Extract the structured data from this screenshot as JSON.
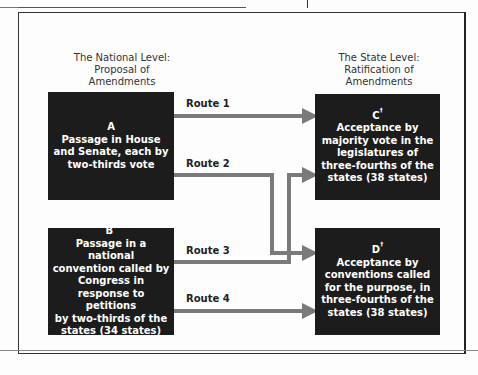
{
  "diagram": {
    "left_header": {
      "line1": "The National Level:",
      "line2": "Proposal of",
      "line3": "Amendments"
    },
    "right_header": {
      "line1": "The State Level:",
      "line2": "Ratification of",
      "line3": "Amendments"
    },
    "boxes": {
      "A": {
        "letter": "A",
        "mark": "",
        "lines": [
          "Passage in House",
          "and Senate, each by",
          "two-thirds vote"
        ]
      },
      "B": {
        "letter": "B",
        "mark": "*",
        "lines": [
          "Passage in a national",
          "convention called by",
          "Congress in",
          "response to petitions",
          "by two-thirds of the",
          "states (34 states)"
        ]
      },
      "C": {
        "letter": "C",
        "mark": "†",
        "lines": [
          "Acceptance by",
          "majority vote in the",
          "legislatures of",
          "three-fourths of the",
          "states (38 states)"
        ]
      },
      "D": {
        "letter": "D",
        "mark": "†",
        "lines": [
          "Acceptance by",
          "conventions called",
          "for the purpose, in",
          "three-fourths of the",
          "states (38 states)"
        ]
      }
    },
    "routes": [
      {
        "label": "Route 1",
        "from": "A",
        "to": "C"
      },
      {
        "label": "Route 2",
        "from": "A",
        "to": "D"
      },
      {
        "label": "Route 3",
        "from": "B",
        "to": "C"
      },
      {
        "label": "Route 4",
        "from": "B",
        "to": "D"
      }
    ],
    "colors": {
      "box": "#1c1c1c",
      "arrow": "#777777",
      "frame": "#333333"
    }
  }
}
